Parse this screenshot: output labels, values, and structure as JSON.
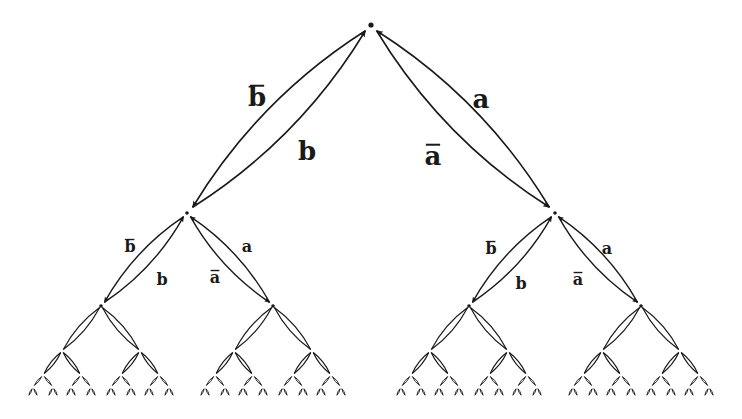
{
  "diagram": {
    "levels": 7,
    "root": {
      "x": 371,
      "y": 25
    },
    "level_y": [
      25,
      213,
      306,
      351,
      375,
      387,
      397
    ],
    "colors": {
      "stroke": "#1a1a1a",
      "background": "#ffffff"
    },
    "generators": {
      "left_down": "b",
      "left_up": "b̄",
      "right_down": "a",
      "right_up": "ā"
    },
    "labels": [
      {
        "text": "b",
        "bar": true,
        "x": 257,
        "y": 106,
        "size": 26,
        "level": 1,
        "side": "left-outer"
      },
      {
        "text": "b",
        "bar": false,
        "x": 307,
        "y": 160,
        "size": 26,
        "level": 1,
        "side": "left-inner"
      },
      {
        "text": "a",
        "bar": false,
        "x": 481,
        "y": 108,
        "size": 26,
        "level": 1,
        "side": "right-outer"
      },
      {
        "text": "a",
        "bar": true,
        "x": 433,
        "y": 165,
        "size": 26,
        "level": 1,
        "side": "right-inner"
      },
      {
        "text": "b",
        "bar": true,
        "x": 130,
        "y": 252,
        "size": 16,
        "level": 2,
        "side": "left-outer"
      },
      {
        "text": "b",
        "bar": false,
        "x": 162,
        "y": 285,
        "size": 16,
        "level": 2,
        "side": "left-inner"
      },
      {
        "text": "a",
        "bar": false,
        "x": 247,
        "y": 252,
        "size": 16,
        "level": 2,
        "side": "right-outer"
      },
      {
        "text": "a",
        "bar": true,
        "x": 215,
        "y": 283,
        "size": 16,
        "level": 2,
        "side": "right-inner"
      },
      {
        "text": "b",
        "bar": true,
        "x": 491,
        "y": 254,
        "size": 16,
        "level": 2,
        "side": "left-outer"
      },
      {
        "text": "b",
        "bar": false,
        "x": 521,
        "y": 289,
        "size": 16,
        "level": 2,
        "side": "left-inner"
      },
      {
        "text": "a",
        "bar": false,
        "x": 607,
        "y": 254,
        "size": 16,
        "level": 2,
        "side": "right-outer"
      },
      {
        "text": "a",
        "bar": true,
        "x": 578,
        "y": 285,
        "size": 16,
        "level": 2,
        "side": "right-inner"
      }
    ],
    "spreads": [
      184,
      86,
      39,
      19,
      10,
      5
    ]
  }
}
